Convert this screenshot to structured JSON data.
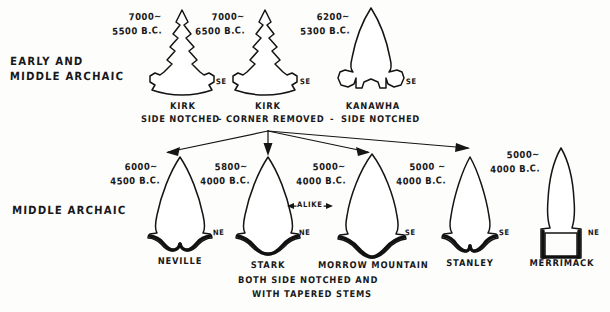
{
  "diagram": {
    "title_rows": [
      {
        "id": "early_middle_archaic",
        "label_line1": "EARLY AND",
        "label_line2": "MIDDLE ARCHAIC"
      },
      {
        "id": "middle_archaic",
        "label_line1": "MIDDLE ARCHAIC"
      }
    ],
    "top_row": {
      "period_label_line1": "EARLY AND",
      "period_label_line2": "MIDDLE ARCHAIC",
      "points": [
        {
          "name": "KIRK",
          "subtitle": "SIDE NOTCHED",
          "date_line1": "7000~",
          "date_line2": "5500 B.C.",
          "region": "SE"
        },
        {
          "name": "KIRK",
          "subtitle": "CORNER REMOVED",
          "date_line1": "7000~",
          "date_line2": "6500 B.C.",
          "region": "SE"
        },
        {
          "name": "KANAWHA",
          "subtitle": "SIDE NOTCHED",
          "date_line1": "6200~",
          "date_line2": "5300 B.C.",
          "region": "SE"
        }
      ],
      "subtitle_dash_left": "-",
      "subtitle_dash_right": "-"
    },
    "bottom_row": {
      "period_label": "MIDDLE ARCHAIC",
      "points": [
        {
          "name": "NEVILLE",
          "date_line1": "6000~",
          "date_line2": "4500 B.C.",
          "region": "NE"
        },
        {
          "name": "STARK",
          "date_line1": "5800~",
          "date_line2": "4000 B.C.",
          "region": "NE"
        },
        {
          "name": "MORROW MOUNTAIN",
          "date_line1": "5000~",
          "date_line2": "4000 B.C.",
          "region": "SE"
        },
        {
          "name": "STANLEY",
          "date_line1": "5000 ~",
          "date_line2": "4000 B.C.",
          "region": "SE"
        },
        {
          "name": "MERRIMACK",
          "date_line1": "5000~",
          "date_line2": "4000 B.C.",
          "region": "NE"
        }
      ],
      "alike_annotation": "ALIKE",
      "caption_line1": "BOTH SIDE NOTCHED AND",
      "caption_line2": "WITH TAPERED STEMS"
    },
    "colors": {
      "ink": "#141414",
      "background": "#fdfdfb"
    }
  }
}
